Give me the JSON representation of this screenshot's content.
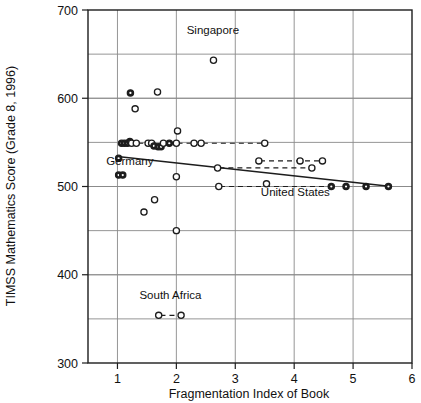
{
  "chart_data": {
    "type": "scatter",
    "title": "",
    "xlabel": "Fragmentation Index of Book",
    "ylabel": "TIMSS Mathematics Score (Grade 8, 1996)",
    "xlim": [
      0.5,
      6.0
    ],
    "ylim": [
      300,
      700
    ],
    "xticks": [
      1,
      2,
      3,
      4,
      5,
      6
    ],
    "xtick_labels": [
      "1",
      "2",
      "3",
      "4",
      "5",
      "6"
    ],
    "yticks": [
      300,
      400,
      500,
      600,
      700
    ],
    "ytick_labels": [
      "300",
      "400",
      "500",
      "600",
      "700"
    ],
    "y_gridlines": [
      350,
      400,
      450,
      500,
      550,
      600,
      650
    ],
    "grid": "horizontal-and-vertical",
    "legend": "none",
    "marker": "open-circle",
    "points": [
      {
        "x": 1.02,
        "y": 513,
        "style": "filled"
      },
      {
        "x": 1.09,
        "y": 513,
        "style": "filled"
      },
      {
        "x": 1.02,
        "y": 532,
        "style": "filled"
      },
      {
        "x": 1.07,
        "y": 549,
        "style": "filled"
      },
      {
        "x": 1.12,
        "y": 549,
        "style": "filled"
      },
      {
        "x": 1.17,
        "y": 549,
        "style": "filled"
      },
      {
        "x": 1.21,
        "y": 551,
        "style": "filled"
      },
      {
        "x": 1.24,
        "y": 549,
        "style": "open"
      },
      {
        "x": 1.32,
        "y": 549,
        "style": "open"
      },
      {
        "x": 1.22,
        "y": 606,
        "style": "filled"
      },
      {
        "x": 1.3,
        "y": 588,
        "style": "open"
      },
      {
        "x": 1.68,
        "y": 607,
        "style": "open"
      },
      {
        "x": 1.45,
        "y": 471,
        "style": "open"
      },
      {
        "x": 1.63,
        "y": 485,
        "style": "open"
      },
      {
        "x": 1.52,
        "y": 549,
        "style": "open"
      },
      {
        "x": 1.58,
        "y": 549,
        "style": "open"
      },
      {
        "x": 1.62,
        "y": 546,
        "style": "filled"
      },
      {
        "x": 1.69,
        "y": 545,
        "style": "filled"
      },
      {
        "x": 1.74,
        "y": 545,
        "style": "filled"
      },
      {
        "x": 1.78,
        "y": 549,
        "style": "open"
      },
      {
        "x": 1.88,
        "y": 549,
        "style": "filled"
      },
      {
        "x": 2.0,
        "y": 549,
        "style": "open"
      },
      {
        "x": 2.02,
        "y": 563,
        "style": "open"
      },
      {
        "x": 2.0,
        "y": 511,
        "style": "open"
      },
      {
        "x": 2.0,
        "y": 450,
        "style": "open"
      },
      {
        "x": 2.3,
        "y": 549,
        "style": "open"
      },
      {
        "x": 2.42,
        "y": 549,
        "style": "open"
      },
      {
        "x": 2.63,
        "y": 643,
        "style": "open"
      },
      {
        "x": 2.72,
        "y": 500,
        "style": "open"
      },
      {
        "x": 2.7,
        "y": 521,
        "style": "open"
      },
      {
        "x": 3.4,
        "y": 529,
        "style": "open"
      },
      {
        "x": 3.5,
        "y": 549,
        "style": "open"
      },
      {
        "x": 3.53,
        "y": 503,
        "style": "open"
      },
      {
        "x": 4.1,
        "y": 529,
        "style": "open"
      },
      {
        "x": 4.3,
        "y": 521,
        "style": "open"
      },
      {
        "x": 4.48,
        "y": 529,
        "style": "open"
      },
      {
        "x": 4.63,
        "y": 500,
        "style": "filled"
      },
      {
        "x": 4.88,
        "y": 500,
        "style": "filled"
      },
      {
        "x": 5.22,
        "y": 500,
        "style": "filled"
      },
      {
        "x": 5.6,
        "y": 500,
        "style": "filled"
      },
      {
        "x": 1.7,
        "y": 354,
        "style": "open"
      },
      {
        "x": 2.08,
        "y": 354,
        "style": "open"
      }
    ],
    "trendline": {
      "x0": 1.0,
      "y0": 534,
      "x1": 5.65,
      "y1": 500
    },
    "annotations": [
      {
        "text": "Singapore",
        "x": 2.62,
        "y": 673,
        "anchor": "middle"
      },
      {
        "text": "Germany",
        "x": 1.21,
        "y": 524,
        "anchor": "middle"
      },
      {
        "text": "United States",
        "x": 4.02,
        "y": 489,
        "anchor": "middle"
      },
      {
        "text": "South Africa",
        "x": 1.9,
        "y": 372,
        "anchor": "middle"
      }
    ],
    "leader_segments": [
      {
        "x0": 1.2,
        "y0": 549,
        "x1": 1.52,
        "y1": 549
      },
      {
        "x0": 2.02,
        "y0": 549,
        "x1": 2.3,
        "y1": 549
      },
      {
        "x0": 2.45,
        "y0": 549,
        "x1": 3.48,
        "y1": 549
      },
      {
        "x0": 3.42,
        "y0": 529,
        "x1": 4.46,
        "y1": 529
      },
      {
        "x0": 2.73,
        "y0": 521,
        "x1": 4.28,
        "y1": 521
      },
      {
        "x0": 2.74,
        "y0": 500,
        "x1": 4.6,
        "y1": 500
      },
      {
        "x0": 1.73,
        "y0": 354,
        "x1": 2.06,
        "y1": 354
      }
    ]
  },
  "axes": {
    "x_title": "Fragmentation Index of Book",
    "y_title": "TIMSS Mathematics Score (Grade 8, 1996)"
  },
  "colors": {
    "ink": "#1d1d1d",
    "grid": "#8a8a8a",
    "background": "#ffffff"
  }
}
